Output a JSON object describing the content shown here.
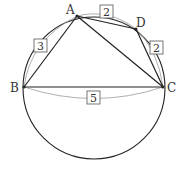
{
  "figure": {
    "points": {
      "A": "A",
      "B": "B",
      "C": "C",
      "D": "D"
    },
    "lengths": {
      "AB": "3",
      "AD": "2",
      "DC": "2",
      "BC": "5"
    },
    "colors": {
      "stroke": "#222222",
      "brace": "#888888",
      "box": "#555555"
    }
  }
}
